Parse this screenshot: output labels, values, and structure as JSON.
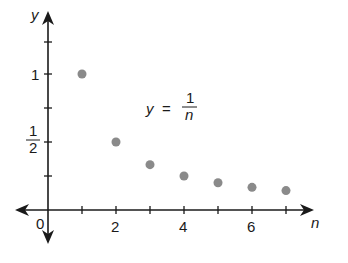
{
  "chart_data": {
    "type": "scatter",
    "title": "",
    "xlabel": "n",
    "ylabel": "y",
    "annotation": {
      "lhs": "y",
      "eq": "=",
      "num": "1",
      "den": "n"
    },
    "x": [
      1,
      2,
      3,
      4,
      5,
      6,
      7
    ],
    "values": [
      1,
      0.5,
      0.3333,
      0.25,
      0.2,
      0.1667,
      0.1429
    ],
    "x_ticks": [
      1,
      2,
      3,
      4,
      5,
      6,
      7
    ],
    "x_tick_labels": {
      "origin": "0",
      "t2": "2",
      "t4": "4",
      "t6": "6"
    },
    "y_ticks": [
      0.25,
      0.5,
      0.75,
      1,
      1.25
    ],
    "y_tick_labels": {
      "one": "1",
      "half_num": "1",
      "half_den": "2"
    },
    "xlim": [
      -1,
      7.8
    ],
    "ylim": [
      -0.25,
      1.45
    ],
    "grid": false,
    "legend": "none",
    "colors": {
      "axis": "#1a1a1a",
      "point": "#8a8a8a"
    }
  }
}
